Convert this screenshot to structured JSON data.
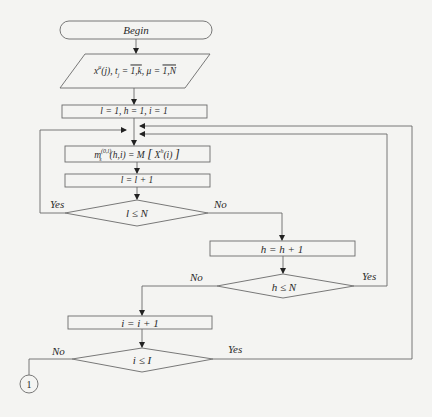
{
  "diagram": {
    "type": "flowchart",
    "colors": {
      "line": "#6a6a6a",
      "background": "#f4f4f2",
      "text": "#2a2a2a"
    },
    "nodes": {
      "begin": {
        "shape": "terminator",
        "label": "Begin"
      },
      "input": {
        "shape": "parallelogram",
        "label": "x^μ(j), t_j = 1,k, μ = 1,N",
        "parts": {
          "x": "x",
          "x_sup": "μ",
          "x_arg": "(j),",
          "t": "t",
          "t_sub": "j",
          "eq1": " = ",
          "range1": "1,k",
          "sep": ", μ = ",
          "range2": "1,N"
        }
      },
      "init": {
        "shape": "process",
        "label": "l = 1, h = 1, i = 1"
      },
      "compute": {
        "shape": "process",
        "label": "m_s^(0,l)(h,i) = M[X^h(i)]",
        "parts": {
          "m": "m",
          "sup": "(0,l)",
          "sub": "s",
          "args": "(h,i) = M",
          "lb": "[",
          "X": "X",
          "Xsup": "h",
          "Xarg": "(i)",
          "rb": "]"
        }
      },
      "inc_l": {
        "shape": "process",
        "label": "l = l + 1"
      },
      "cond_l": {
        "shape": "decision",
        "label": "l ≤ N"
      },
      "inc_h": {
        "shape": "process",
        "label": "h = h + 1"
      },
      "cond_h": {
        "shape": "decision",
        "label": "h ≤ N"
      },
      "inc_i": {
        "shape": "process",
        "label": "i = i + 1"
      },
      "cond_i": {
        "shape": "decision",
        "label": "i ≤ I"
      },
      "connector": {
        "shape": "connector",
        "label": "1"
      }
    },
    "branches": {
      "cond_l_yes": "Yes",
      "cond_l_no": "No",
      "cond_h_yes": "Yes",
      "cond_h_no": "No",
      "cond_i_yes": "Yes",
      "cond_i_no": "No"
    },
    "edges": [
      {
        "from": "begin",
        "to": "input"
      },
      {
        "from": "input",
        "to": "init"
      },
      {
        "from": "init",
        "to": "compute"
      },
      {
        "from": "compute",
        "to": "inc_l"
      },
      {
        "from": "inc_l",
        "to": "cond_l"
      },
      {
        "from": "cond_l",
        "to": "compute",
        "label": "Yes"
      },
      {
        "from": "cond_l",
        "to": "inc_h",
        "label": "No"
      },
      {
        "from": "inc_h",
        "to": "cond_h"
      },
      {
        "from": "cond_h",
        "to": "compute",
        "label": "Yes"
      },
      {
        "from": "cond_h",
        "to": "inc_i",
        "label": "No"
      },
      {
        "from": "inc_i",
        "to": "cond_i"
      },
      {
        "from": "cond_i",
        "to": "compute",
        "label": "Yes"
      },
      {
        "from": "cond_i",
        "to": "connector",
        "label": "No"
      }
    ]
  }
}
